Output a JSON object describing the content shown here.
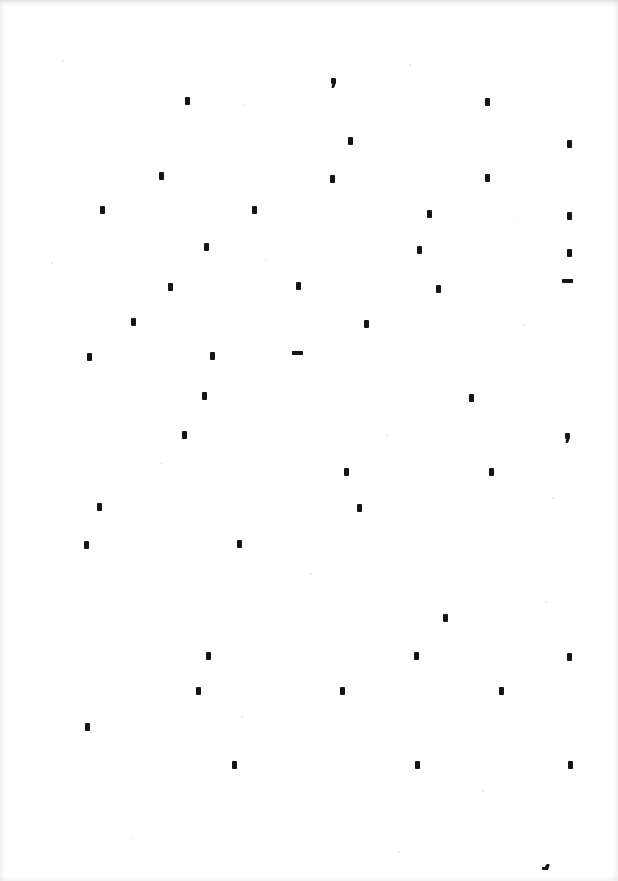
{
  "page": {
    "width": 618,
    "height": 881,
    "background_color": "#ffffff",
    "ink_color": "#151515"
  },
  "marks": [
    {
      "kind": "comma",
      "glyph": ",",
      "x": 331,
      "y": 78
    },
    {
      "kind": "period",
      "glyph": ".",
      "x": 185,
      "y": 97
    },
    {
      "kind": "period",
      "glyph": ".",
      "x": 485,
      "y": 98
    },
    {
      "kind": "period",
      "glyph": ".",
      "x": 348,
      "y": 137
    },
    {
      "kind": "period",
      "glyph": ".",
      "x": 567,
      "y": 140
    },
    {
      "kind": "period",
      "glyph": ".",
      "x": 159,
      "y": 172
    },
    {
      "kind": "period",
      "glyph": ".",
      "x": 330,
      "y": 175
    },
    {
      "kind": "period",
      "glyph": ".",
      "x": 485,
      "y": 174
    },
    {
      "kind": "period",
      "glyph": ".",
      "x": 100,
      "y": 206
    },
    {
      "kind": "period",
      "glyph": ".",
      "x": 252,
      "y": 206
    },
    {
      "kind": "period",
      "glyph": ".",
      "x": 427,
      "y": 210
    },
    {
      "kind": "period",
      "glyph": ".",
      "x": 567,
      "y": 212
    },
    {
      "kind": "period",
      "glyph": ".",
      "x": 204,
      "y": 243
    },
    {
      "kind": "period",
      "glyph": ".",
      "x": 417,
      "y": 246
    },
    {
      "kind": "period",
      "glyph": ".",
      "x": 567,
      "y": 249
    },
    {
      "kind": "period",
      "glyph": ".",
      "x": 168,
      "y": 283
    },
    {
      "kind": "period",
      "glyph": ".",
      "x": 296,
      "y": 282
    },
    {
      "kind": "period",
      "glyph": ".",
      "x": 436,
      "y": 285
    },
    {
      "kind": "hyphen",
      "glyph": "-",
      "x": 562,
      "y": 279
    },
    {
      "kind": "period",
      "glyph": ".",
      "x": 131,
      "y": 318
    },
    {
      "kind": "period",
      "glyph": ".",
      "x": 364,
      "y": 320
    },
    {
      "kind": "period",
      "glyph": ".",
      "x": 87,
      "y": 353
    },
    {
      "kind": "period",
      "glyph": ".",
      "x": 210,
      "y": 352
    },
    {
      "kind": "hyphen",
      "glyph": "-",
      "x": 292,
      "y": 351
    },
    {
      "kind": "period",
      "glyph": ".",
      "x": 202,
      "y": 392
    },
    {
      "kind": "period",
      "glyph": ".",
      "x": 469,
      "y": 394
    },
    {
      "kind": "period",
      "glyph": ".",
      "x": 182,
      "y": 431
    },
    {
      "kind": "comma",
      "glyph": ",",
      "x": 565,
      "y": 433
    },
    {
      "kind": "period",
      "glyph": ".",
      "x": 344,
      "y": 468
    },
    {
      "kind": "period",
      "glyph": ".",
      "x": 489,
      "y": 468
    },
    {
      "kind": "period",
      "glyph": ".",
      "x": 97,
      "y": 503
    },
    {
      "kind": "period",
      "glyph": ".",
      "x": 357,
      "y": 504
    },
    {
      "kind": "period",
      "glyph": ".",
      "x": 84,
      "y": 541
    },
    {
      "kind": "period",
      "glyph": ".",
      "x": 237,
      "y": 540
    },
    {
      "kind": "period",
      "glyph": ".",
      "x": 443,
      "y": 614
    },
    {
      "kind": "period",
      "glyph": ".",
      "x": 206,
      "y": 652
    },
    {
      "kind": "period",
      "glyph": ".",
      "x": 414,
      "y": 652
    },
    {
      "kind": "period",
      "glyph": ".",
      "x": 567,
      "y": 653
    },
    {
      "kind": "period",
      "glyph": ".",
      "x": 196,
      "y": 687
    },
    {
      "kind": "period",
      "glyph": ".",
      "x": 340,
      "y": 687
    },
    {
      "kind": "period",
      "glyph": ".",
      "x": 499,
      "y": 687
    },
    {
      "kind": "period",
      "glyph": ".",
      "x": 85,
      "y": 723
    },
    {
      "kind": "period",
      "glyph": ".",
      "x": 232,
      "y": 761
    },
    {
      "kind": "period",
      "glyph": ".",
      "x": 415,
      "y": 761
    },
    {
      "kind": "period",
      "glyph": ".",
      "x": 568,
      "y": 761
    },
    {
      "kind": "smudge",
      "glyph": "'",
      "x": 542,
      "y": 864
    }
  ],
  "specks": [
    {
      "x": 62,
      "y": 60,
      "w": 2,
      "h": 2
    },
    {
      "x": 243,
      "y": 104,
      "w": 2,
      "h": 1
    },
    {
      "x": 409,
      "y": 64,
      "w": 2,
      "h": 2
    },
    {
      "x": 516,
      "y": 219,
      "w": 2,
      "h": 1
    },
    {
      "x": 51,
      "y": 262,
      "w": 2,
      "h": 2
    },
    {
      "x": 265,
      "y": 259,
      "w": 1,
      "h": 2
    },
    {
      "x": 523,
      "y": 324,
      "w": 2,
      "h": 2
    },
    {
      "x": 160,
      "y": 463,
      "w": 2,
      "h": 1
    },
    {
      "x": 386,
      "y": 434,
      "w": 2,
      "h": 2
    },
    {
      "x": 552,
      "y": 497,
      "w": 2,
      "h": 2
    },
    {
      "x": 310,
      "y": 573,
      "w": 2,
      "h": 2
    },
    {
      "x": 545,
      "y": 601,
      "w": 2,
      "h": 2
    },
    {
      "x": 241,
      "y": 716,
      "w": 2,
      "h": 2
    },
    {
      "x": 482,
      "y": 790,
      "w": 2,
      "h": 2
    },
    {
      "x": 131,
      "y": 838,
      "w": 2,
      "h": 1
    },
    {
      "x": 398,
      "y": 851,
      "w": 2,
      "h": 2
    }
  ]
}
